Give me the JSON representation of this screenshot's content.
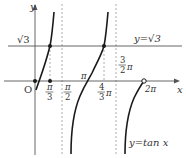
{
  "diagram": {
    "type": "function-graph",
    "function_label": "y=tan x",
    "horizontal_line_label": "y=√3",
    "axes": {
      "x_label": "x",
      "y_label": "y",
      "origin_label": "O"
    },
    "y_tick_label": "√3",
    "x_tick_labels": {
      "pi_over_3": {
        "num": "π",
        "den": "3"
      },
      "pi_over_2": {
        "num": "π",
        "den": "2"
      },
      "pi": "π",
      "four_thirds_pi": {
        "num": "4",
        "den": "3",
        "suffix": "π"
      },
      "three_halves_pi": {
        "num": "3",
        "den": "2",
        "suffix": "π"
      },
      "two_pi": "2π"
    },
    "asymptotes": [
      "π/2",
      "3π/2"
    ],
    "marked_points": [
      "(0,0) filled",
      "(π/3,0) filled",
      "(π/3,√3) filled",
      "(4π/3,√3) filled",
      "(2π,0) open"
    ],
    "colors": {
      "curve": "#1a1a1a",
      "axis": "#555555",
      "dashed": "#888888",
      "text": "#333333"
    }
  }
}
